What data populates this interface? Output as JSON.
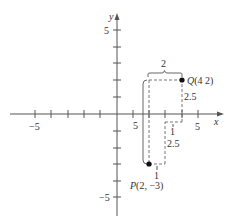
{
  "diagram": {
    "axes": {
      "x_label": "x",
      "y_label": "y",
      "x_ticks": [
        -5,
        -4,
        -3,
        -2,
        -1,
        1,
        2,
        3,
        4,
        5
      ],
      "y_ticks": [
        -5,
        -4,
        -3,
        -2,
        -1,
        1,
        2,
        3,
        4,
        5
      ],
      "x_tick_labels": {
        "neg5": "−5",
        "pos5": "5",
        "stray5": "5"
      },
      "y_tick_labels": {
        "pos5": "5",
        "neg5": "−5"
      }
    },
    "points": {
      "P": {
        "label": "P(2, −3)",
        "x": 2,
        "y": -3
      },
      "Q": {
        "label": "Q(4  2)",
        "x": 4,
        "y": 2
      }
    },
    "annotations": {
      "top_brace": "2",
      "right_vertical": "2.5",
      "mid_horizontal": "1",
      "mid_vertical": "2.5",
      "bottom_horizontal": "1"
    }
  }
}
